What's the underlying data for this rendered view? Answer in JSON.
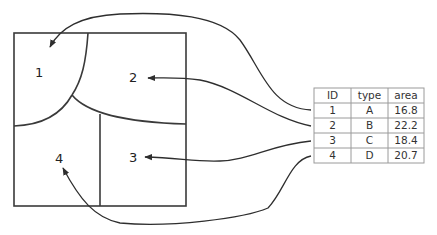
{
  "map": {
    "regions": [
      {
        "id": "1",
        "label": "1",
        "x": 38,
        "y": 77
      },
      {
        "id": "2",
        "label": "2",
        "x": 133,
        "y": 82
      },
      {
        "id": "3",
        "label": "3",
        "x": 133,
        "y": 162
      },
      {
        "id": "4",
        "label": "4",
        "x": 59,
        "y": 163
      }
    ]
  },
  "table": {
    "headers": [
      "ID",
      "type",
      "area"
    ],
    "rows": [
      [
        "1",
        "A",
        "16.8"
      ],
      [
        "2",
        "B",
        "22.2"
      ],
      [
        "3",
        "C",
        "18.4"
      ],
      [
        "4",
        "D",
        "20.7"
      ]
    ]
  },
  "colors": {
    "line": "#2e2e2e",
    "table_border": "#9a9a9a",
    "text": "#222222"
  }
}
